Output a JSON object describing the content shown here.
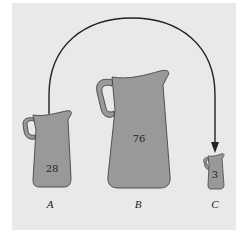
{
  "diagram": {
    "colors": {
      "background": "#e9e9e9",
      "pitcher_fill": "#999999",
      "outline": "#333333",
      "arrow": "#222222"
    },
    "pitchers": [
      {
        "label": "A",
        "value": "28"
      },
      {
        "label": "B",
        "value": "76"
      },
      {
        "label": "C",
        "value": "3"
      }
    ],
    "arrow": {
      "from": "A",
      "to": "C"
    }
  }
}
